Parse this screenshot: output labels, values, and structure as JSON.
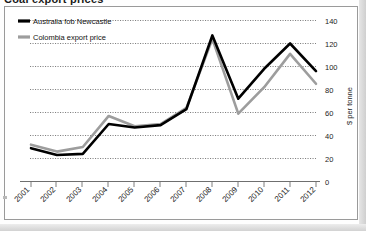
{
  "figure": {
    "cropped_title_fragment": "Coal export prices",
    "background_color": "#ffffff",
    "frame_color": "#9a9a9a"
  },
  "legend": {
    "position": "top-left",
    "entries": [
      {
        "label": "Australia fob Newcastle",
        "color": "#000000",
        "marker": "line-swatch"
      },
      {
        "label": "Colombia export price",
        "color": "#9d9d9d",
        "marker": "line-swatch"
      }
    ]
  },
  "axes": {
    "y_axis_title": "$ per tonne",
    "y_ticks": [
      "0",
      "20",
      "40",
      "60",
      "80",
      "100",
      "120",
      "140"
    ],
    "x_ticks": [
      "2001",
      "2002",
      "2003",
      "2004",
      "2005",
      "2006",
      "2007",
      "2008",
      "2009",
      "2010",
      "2011",
      "2012"
    ]
  },
  "chart_data": {
    "type": "line",
    "title": "Coal export prices",
    "xlabel": "",
    "ylabel": "$ per tonne",
    "ylim": [
      0,
      140
    ],
    "ytick_step": 20,
    "grid": true,
    "y_axis_side": "right",
    "legend_position": "top-left",
    "categories": [
      "2001",
      "2002",
      "2003",
      "2004",
      "2005",
      "2006",
      "2007",
      "2008",
      "2009",
      "2010",
      "2011",
      "2012"
    ],
    "series": [
      {
        "name": "Australia fob Newcastle",
        "color": "#000000",
        "values": [
          29,
          23,
          24,
          50,
          47,
          49,
          63,
          127,
          72,
          98,
          120,
          96
        ]
      },
      {
        "name": "Colombia export price",
        "color": "#9d9d9d",
        "values": [
          32,
          26,
          30,
          57,
          48,
          50,
          64,
          124,
          59,
          82,
          111,
          85
        ]
      }
    ]
  }
}
